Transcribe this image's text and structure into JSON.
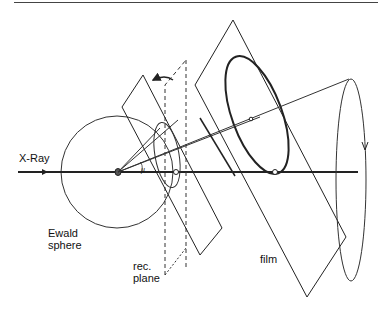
{
  "figure": {
    "type": "Ewald sphere / reciprocal lattice plane to film projection diagram",
    "labels": {
      "xray": "X-Ray",
      "ewald_line1": "Ewald",
      "ewald_line2": "sphere",
      "rec_line1": "rec.",
      "rec_line2": "plane",
      "film": "film",
      "mu": "μ"
    },
    "colors": {
      "line": "#222222",
      "background": "#ffffff"
    }
  }
}
